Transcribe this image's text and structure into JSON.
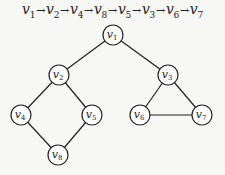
{
  "traversal": {
    "sequence": [
      {
        "name": "v",
        "sub": "1"
      },
      {
        "name": "v",
        "sub": "2"
      },
      {
        "name": "v",
        "sub": "4"
      },
      {
        "name": "v",
        "sub": "8"
      },
      {
        "name": "v",
        "sub": "5"
      },
      {
        "name": "v",
        "sub": "3"
      },
      {
        "name": "v",
        "sub": "6"
      },
      {
        "name": "v",
        "sub": "7"
      }
    ],
    "arrow": "→"
  },
  "graph": {
    "nodes": [
      {
        "id": "v1",
        "name": "v",
        "sub": "1",
        "x": 113,
        "y": 35
      },
      {
        "id": "v2",
        "name": "v",
        "sub": "2",
        "x": 59,
        "y": 75
      },
      {
        "id": "v3",
        "name": "v",
        "sub": "3",
        "x": 168,
        "y": 75
      },
      {
        "id": "v4",
        "name": "v",
        "sub": "4",
        "x": 21,
        "y": 115
      },
      {
        "id": "v5",
        "name": "v",
        "sub": "5",
        "x": 92,
        "y": 115
      },
      {
        "id": "v6",
        "name": "v",
        "sub": "6",
        "x": 140,
        "y": 115
      },
      {
        "id": "v7",
        "name": "v",
        "sub": "7",
        "x": 202,
        "y": 115
      },
      {
        "id": "v8",
        "name": "v",
        "sub": "8",
        "x": 58,
        "y": 155
      }
    ],
    "edges": [
      [
        "v1",
        "v2"
      ],
      [
        "v1",
        "v3"
      ],
      [
        "v2",
        "v4"
      ],
      [
        "v2",
        "v5"
      ],
      [
        "v4",
        "v8"
      ],
      [
        "v5",
        "v8"
      ],
      [
        "v3",
        "v6"
      ],
      [
        "v3",
        "v7"
      ],
      [
        "v6",
        "v7"
      ]
    ],
    "node_radius": 10,
    "stroke_color": "#222222",
    "fill_color": "#ffffff"
  }
}
